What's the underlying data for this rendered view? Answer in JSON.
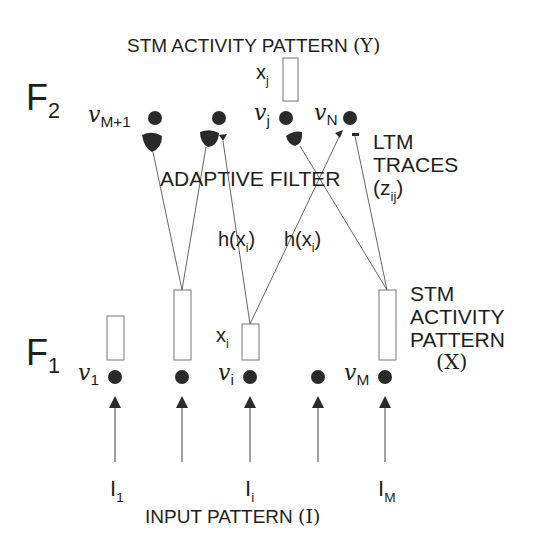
{
  "diagram": {
    "title_f2": "STM ACTIVITY PATTERN",
    "title_f2_symbol": "(Y)",
    "title_f1_lines": [
      "STM",
      "ACTIVITY",
      "PATTERN"
    ],
    "title_f1_symbol": "(X)",
    "input_label": "INPUT PATTERN",
    "input_symbol": "(I)",
    "adaptive_filter": "ADAPTIVE FILTER",
    "ltm_lines": [
      "LTM",
      "TRACES"
    ],
    "ltm_symbol": "(z",
    "ltm_sub": "ij",
    "ltm_close": ")",
    "layers": {
      "f2": {
        "name": "F",
        "sub": "2"
      },
      "f1": {
        "name": "F",
        "sub": "1"
      }
    },
    "f2_nodes": [
      {
        "label": "v",
        "sub": "M+1",
        "x": 155
      },
      {
        "label": "",
        "sub": "",
        "x": 219
      },
      {
        "label": "v",
        "sub": "j",
        "x": 286
      },
      {
        "label": "v",
        "sub": "N",
        "x": 350
      }
    ],
    "f2_activity": {
      "label": "x",
      "sub": "j"
    },
    "f1_nodes": [
      {
        "label": "v",
        "sub": "1",
        "x": 115
      },
      {
        "label": "",
        "sub": "",
        "x": 182
      },
      {
        "label": "v",
        "sub": "i",
        "x": 250
      },
      {
        "label": "",
        "sub": "",
        "x": 318
      },
      {
        "label": "v",
        "sub": "M",
        "x": 385
      }
    ],
    "f1_activity": {
      "label": "x",
      "sub": "i"
    },
    "signal_labels": [
      {
        "text": "h(x",
        "sub": "i",
        "close": ")"
      },
      {
        "text": "h(x",
        "sub": "i",
        "close": ")"
      }
    ],
    "inputs": [
      {
        "label": "I",
        "sub": "1"
      },
      {
        "label": "I",
        "sub": "i"
      },
      {
        "label": "I",
        "sub": "M"
      }
    ],
    "colors": {
      "ink": "#1e1e1e",
      "node": "#2a2a2a",
      "line": "#444444",
      "box": "#777777"
    }
  }
}
